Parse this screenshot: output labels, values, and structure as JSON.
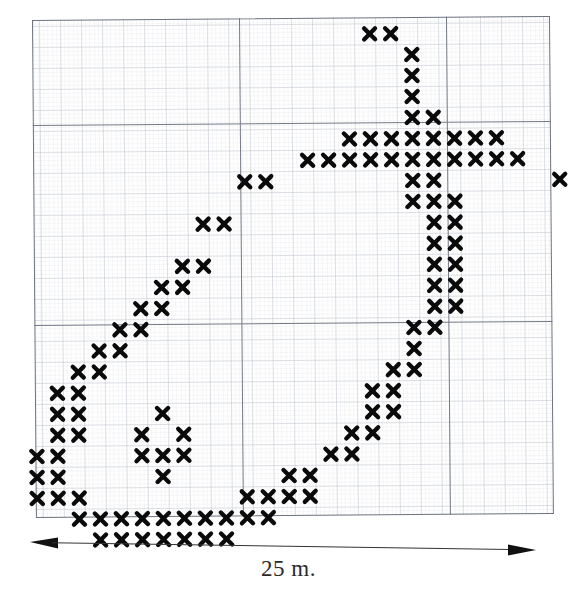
{
  "figure": {
    "type": "scatter-distribution-map",
    "scale_bar": {
      "label": "25 m.",
      "icon_left": "arrow-left-icon",
      "icon_right": "arrow-right-icon",
      "length_meters": 25
    },
    "grid": {
      "cell_pitch_px": 21,
      "minor_grid": true,
      "major_grid": true,
      "major_v_positions_px": [
        207,
        414
      ],
      "major_h_positions_px": [
        105,
        305
      ],
      "border_color": "#6d7480",
      "grid_color": "#8a90a0",
      "background": "#ffffff"
    },
    "mark": {
      "glyph": "x",
      "color": "#0a0a0a",
      "size_px": 17
    }
  },
  "chart_data": {
    "type": "scatter",
    "title": "",
    "xlabel": "25 m.",
    "ylabel": "",
    "grid": true,
    "legend": null,
    "marker": "x",
    "units": "grid cells (1 cell = 21 px)",
    "xlim": [
      0,
      24
    ],
    "ylim": [
      0,
      23
    ],
    "note": "Archaeological find-spot distribution plotted on graph paper; each x is one recorded point on a 25 m wide survey square.",
    "points": [
      [
        15,
        0
      ],
      [
        16,
        0
      ],
      [
        17,
        1
      ],
      [
        17,
        2
      ],
      [
        17,
        3
      ],
      [
        17,
        4
      ],
      [
        18,
        4
      ],
      [
        14,
        5
      ],
      [
        15,
        5
      ],
      [
        16,
        5
      ],
      [
        17,
        5
      ],
      [
        18,
        5
      ],
      [
        19,
        5
      ],
      [
        20,
        5
      ],
      [
        21,
        5
      ],
      [
        12,
        6
      ],
      [
        13,
        6
      ],
      [
        14,
        6
      ],
      [
        15,
        6
      ],
      [
        16,
        6
      ],
      [
        17,
        6
      ],
      [
        18,
        6
      ],
      [
        19,
        6
      ],
      [
        20,
        6
      ],
      [
        21,
        6
      ],
      [
        22,
        6
      ],
      [
        9,
        7
      ],
      [
        10,
        7
      ],
      [
        17,
        7
      ],
      [
        18,
        7
      ],
      [
        24,
        7
      ],
      [
        17,
        8
      ],
      [
        18,
        8
      ],
      [
        19,
        8
      ],
      [
        7,
        9
      ],
      [
        8,
        9
      ],
      [
        18,
        9
      ],
      [
        19,
        9
      ],
      [
        18,
        10
      ],
      [
        19,
        10
      ],
      [
        6,
        11
      ],
      [
        7,
        11
      ],
      [
        18,
        11
      ],
      [
        19,
        11
      ],
      [
        5,
        12
      ],
      [
        6,
        12
      ],
      [
        18,
        12
      ],
      [
        19,
        12
      ],
      [
        4,
        13
      ],
      [
        5,
        13
      ],
      [
        18,
        13
      ],
      [
        19,
        13
      ],
      [
        3,
        14
      ],
      [
        4,
        14
      ],
      [
        17,
        14
      ],
      [
        18,
        14
      ],
      [
        2,
        15
      ],
      [
        3,
        15
      ],
      [
        17,
        15
      ],
      [
        1,
        16
      ],
      [
        2,
        16
      ],
      [
        16,
        16
      ],
      [
        17,
        16
      ],
      [
        0,
        17
      ],
      [
        1,
        17
      ],
      [
        15,
        17
      ],
      [
        16,
        17
      ],
      [
        0,
        18
      ],
      [
        1,
        18
      ],
      [
        5,
        18
      ],
      [
        15,
        18
      ],
      [
        16,
        18
      ],
      [
        0,
        19
      ],
      [
        1,
        19
      ],
      [
        4,
        19
      ],
      [
        6,
        19
      ],
      [
        14,
        19
      ],
      [
        15,
        19
      ],
      [
        -1,
        20
      ],
      [
        0,
        20
      ],
      [
        4,
        20
      ],
      [
        5,
        20
      ],
      [
        6,
        20
      ],
      [
        13,
        20
      ],
      [
        14,
        20
      ],
      [
        -1,
        21
      ],
      [
        0,
        21
      ],
      [
        5,
        21
      ],
      [
        11,
        21
      ],
      [
        12,
        21
      ],
      [
        -1,
        22
      ],
      [
        0,
        22
      ],
      [
        1,
        22
      ],
      [
        9,
        22
      ],
      [
        10,
        22
      ],
      [
        11,
        22
      ],
      [
        12,
        22
      ],
      [
        1,
        23
      ],
      [
        2,
        23
      ],
      [
        3,
        23
      ],
      [
        4,
        23
      ],
      [
        5,
        23
      ],
      [
        6,
        23
      ],
      [
        7,
        23
      ],
      [
        8,
        23
      ],
      [
        9,
        23
      ],
      [
        10,
        23
      ],
      [
        8,
        24
      ],
      [
        2,
        24
      ],
      [
        3,
        24
      ],
      [
        4,
        24
      ],
      [
        5,
        24
      ],
      [
        6,
        24
      ],
      [
        7,
        24
      ]
    ]
  }
}
